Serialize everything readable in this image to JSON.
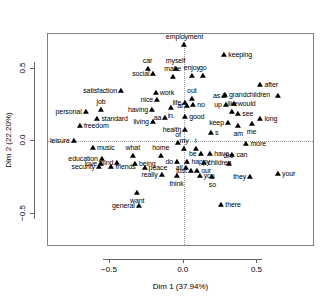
{
  "chart_data": {
    "type": "scatter",
    "title": "",
    "xlabel": "Dim 1 (37.94%)",
    "ylabel": "Dim 2 (22.20%)",
    "xlim": [
      -0.92,
      0.89
    ],
    "ylim": [
      -0.73,
      0.74
    ],
    "xticks": [
      -0.5,
      0.0,
      0.5
    ],
    "xticklabels": [
      "-0.5",
      "0.0",
      "0.5"
    ],
    "yticks": [
      -0.5,
      0.0,
      0.5
    ],
    "yticklabels": [
      "-0.5",
      "0.0",
      "0.5"
    ],
    "grid": false,
    "reference_lines": {
      "x": 0.0,
      "y": 0.0,
      "style": "dotted"
    },
    "legend": null,
    "marker": "filled-triangle",
    "marker_color": "#000000",
    "points": [
      {
        "label": "employment",
        "x": 0.005,
        "y": 0.665,
        "pos": "t"
      },
      {
        "label": "keeping",
        "x": 0.275,
        "y": 0.595,
        "pos": "l"
      },
      {
        "label": "car",
        "x": -0.245,
        "y": 0.5,
        "pos": "t"
      },
      {
        "label": "myself",
        "x": -0.055,
        "y": 0.5,
        "pos": "t"
      },
      {
        "label": "social",
        "x": -0.205,
        "y": 0.462,
        "pos": "r"
      },
      {
        "label": "make",
        "x": -0.075,
        "y": 0.44,
        "pos": "t"
      },
      {
        "label": "enjoy",
        "x": 0.055,
        "y": 0.45,
        "pos": "t"
      },
      {
        "label": "go",
        "x": 0.13,
        "y": 0.45,
        "pos": "t"
      },
      {
        "label": "after",
        "x": 0.52,
        "y": 0.39,
        "pos": "l"
      },
      {
        "label": "satisfaction",
        "x": -0.425,
        "y": 0.345,
        "pos": "r"
      },
      {
        "label": "work",
        "x": -0.19,
        "y": 0.33,
        "pos": "l"
      },
      {
        "label": "grandchildren",
        "x": 0.28,
        "y": 0.32,
        "pos": "l"
      },
      {
        "label": "",
        "x": 0.64,
        "y": 0.31,
        "pos": "l"
      },
      {
        "label": "as",
        "x": 0.275,
        "y": 0.312,
        "pos": "r"
      },
      {
        "label": "nice",
        "x": -0.18,
        "y": 0.282,
        "pos": "r"
      },
      {
        "label": "out",
        "x": 0.055,
        "y": 0.29,
        "pos": "t"
      },
      {
        "label": "life",
        "x": 0.01,
        "y": 0.262,
        "pos": "r"
      },
      {
        "label": "would",
        "x": 0.34,
        "y": 0.255,
        "pos": "l"
      },
      {
        "label": "up",
        "x": 0.285,
        "y": 0.25,
        "pos": "r"
      },
      {
        "label": "no",
        "x": 0.065,
        "y": 0.248,
        "pos": "l"
      },
      {
        "label": "at",
        "x": 0.022,
        "y": 0.24,
        "pos": "r"
      },
      {
        "label": "in.",
        "x": -0.085,
        "y": 0.232,
        "pos": "b"
      },
      {
        "label": "having",
        "x": -0.215,
        "y": 0.215,
        "pos": "r"
      },
      {
        "label": "job",
        "x": -0.56,
        "y": 0.215,
        "pos": "t"
      },
      {
        "label": "personal",
        "x": -0.665,
        "y": 0.2,
        "pos": "r"
      },
      {
        "label": "like",
        "x": 0.33,
        "y": 0.205,
        "pos": "t"
      },
      {
        "label": "see",
        "x": 0.37,
        "y": 0.19,
        "pos": "l"
      },
      {
        "label": "good",
        "x": 0.01,
        "y": 0.17,
        "pos": "l"
      },
      {
        "label": "standard",
        "x": -0.585,
        "y": 0.155,
        "pos": "l"
      },
      {
        "label": "aa",
        "x": -0.125,
        "y": 0.16,
        "pos": "r"
      },
      {
        "label": "living",
        "x": -0.21,
        "y": 0.13,
        "pos": "r"
      },
      {
        "label": "long",
        "x": 0.52,
        "y": 0.155,
        "pos": "l"
      },
      {
        "label": "keep",
        "x": 0.3,
        "y": 0.125,
        "pos": "r"
      },
      {
        "label": "me",
        "x": 0.46,
        "y": 0.12,
        "pos": "b"
      },
      {
        "label": "am",
        "x": 0.37,
        "y": 0.105,
        "pos": "b"
      },
      {
        "label": "freedom",
        "x": -0.705,
        "y": 0.105,
        "pos": "l"
      },
      {
        "label": "health",
        "x": 0.01,
        "y": 0.08,
        "pos": "r"
      },
      {
        "label": "s",
        "x": 0.185,
        "y": 0.055,
        "pos": "l"
      },
      {
        "label": "leisure",
        "x": -0.745,
        "y": 0.005,
        "pos": "r"
      },
      {
        "label": "of",
        "x": -0.038,
        "y": -0.01,
        "pos": "t"
      },
      {
        "label": "more",
        "x": 0.425,
        "y": -0.022,
        "pos": "l"
      },
      {
        "label": "music",
        "x": -0.615,
        "y": -0.045,
        "pos": "l"
      },
      {
        "label": "my",
        "x": 0.002,
        "y": -0.055,
        "pos": "t"
      },
      {
        "label": "i",
        "x": 0.082,
        "y": -0.055,
        "pos": "t"
      },
      {
        "label": "have",
        "x": 0.18,
        "y": -0.085,
        "pos": "l"
      },
      {
        "label": "be",
        "x": 0.115,
        "y": -0.09,
        "pos": "r"
      },
      {
        "label": "can",
        "x": 0.33,
        "y": -0.095,
        "pos": "l"
      },
      {
        "label": "what",
        "x": -0.345,
        "y": -0.105,
        "pos": "t"
      },
      {
        "label": "home",
        "x": -0.155,
        "y": -0.105,
        "pos": "t"
      },
      {
        "label": "education",
        "x": -0.555,
        "y": -0.12,
        "pos": "r"
      },
      {
        "label": "happy",
        "x": 0.025,
        "y": -0.14,
        "pos": "l"
      },
      {
        "label": "do",
        "x": -0.045,
        "y": -0.145,
        "pos": "r"
      },
      {
        "label": "mind",
        "x": -0.45,
        "y": -0.15,
        "pos": "r"
      },
      {
        "label": "being",
        "x": -0.33,
        "y": -0.155,
        "pos": "l"
      },
      {
        "label": "love",
        "x": -0.56,
        "y": -0.155,
        "pos": "r"
      },
      {
        "label": "children",
        "x": 0.135,
        "y": -0.152,
        "pos": "l"
      },
      {
        "label": "are",
        "x": 0.305,
        "y": -0.158,
        "pos": "t"
      },
      {
        "label": "friends",
        "x": -0.49,
        "y": -0.18,
        "pos": "l"
      },
      {
        "label": "peace",
        "x": -0.265,
        "y": -0.185,
        "pos": "l"
      },
      {
        "label": "security",
        "x": -0.575,
        "y": -0.18,
        "pos": "r"
      },
      {
        "label": "all",
        "x": 0.018,
        "y": -0.182,
        "pos": "r"
      },
      {
        "label": "just",
        "x": 0.048,
        "y": -0.205,
        "pos": "r"
      },
      {
        "label": "our",
        "x": 0.092,
        "y": -0.208,
        "pos": "l"
      },
      {
        "label": "really",
        "x": -0.15,
        "y": -0.23,
        "pos": "r"
      },
      {
        "label": "think",
        "x": -0.048,
        "y": -0.238,
        "pos": "b"
      },
      {
        "label": "you",
        "x": 0.108,
        "y": -0.242,
        "pos": "l"
      },
      {
        "label": "so",
        "x": 0.195,
        "y": -0.245,
        "pos": "b"
      },
      {
        "label": "they",
        "x": 0.45,
        "y": -0.245,
        "pos": "r"
      },
      {
        "label": "your",
        "x": 0.64,
        "y": -0.225,
        "pos": "l"
      },
      {
        "label": "want",
        "x": -0.315,
        "y": -0.36,
        "pos": "b"
      },
      {
        "label": "there",
        "x": 0.255,
        "y": -0.44,
        "pos": "l"
      },
      {
        "label": "general",
        "x": -0.305,
        "y": -0.45,
        "pos": "r"
      }
    ]
  }
}
